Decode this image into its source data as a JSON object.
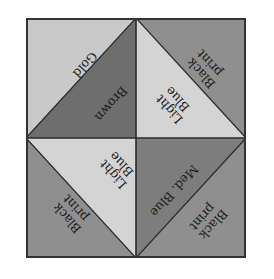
{
  "diagram": {
    "colors": {
      "gold": "#c9c9c9",
      "brown": "#6e6e6e",
      "black_print": "#8f8f8f",
      "light_blue": "#d4d4d4",
      "med_blue": "#7d7d7d",
      "border": "#333333"
    },
    "quadrants": [
      {
        "position": "top-left",
        "triangles": [
          {
            "corner": "upper-left",
            "label": "Gold"
          },
          {
            "corner": "lower-right",
            "label": "Brown"
          }
        ]
      },
      {
        "position": "top-right",
        "triangles": [
          {
            "corner": "upper-right",
            "label_line1": "Black",
            "label_line2": "print"
          },
          {
            "corner": "lower-left",
            "label_line1": "Light",
            "label_line2": "Blue"
          }
        ]
      },
      {
        "position": "bottom-left",
        "triangles": [
          {
            "corner": "upper-right",
            "label_line1": "Light",
            "label_line2": "Blue"
          },
          {
            "corner": "lower-left",
            "label_line1": "Black",
            "label_line2": "print"
          }
        ]
      },
      {
        "position": "bottom-right",
        "triangles": [
          {
            "corner": "upper-left",
            "label": "Med. Blue"
          },
          {
            "corner": "lower-right",
            "label_line1": "Black",
            "label_line2": "print"
          }
        ]
      }
    ]
  }
}
